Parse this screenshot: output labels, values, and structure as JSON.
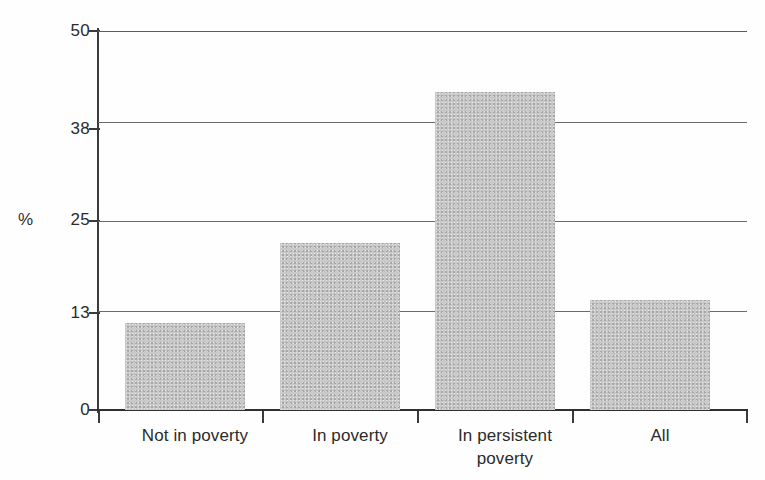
{
  "chart_data": {
    "type": "bar",
    "title": "",
    "subtitle": "",
    "xlabel": "",
    "ylabel": "%",
    "ylim": [
      0,
      50
    ],
    "yticks": [
      0,
      13,
      25,
      38,
      50
    ],
    "ytick_labels": [
      "0",
      "13",
      "25",
      "38",
      "50"
    ],
    "grid": "horizontal",
    "legend": "none",
    "bar_color": "#c9c9c9",
    "axis_color": "#2f2f2f",
    "categories": [
      "Not in poverty",
      "In poverty",
      "In persistent poverty",
      "All"
    ],
    "category_lines": [
      [
        "Not in poverty"
      ],
      [
        "In poverty"
      ],
      [
        "In persistent",
        "poverty"
      ],
      [
        "All"
      ]
    ],
    "values": [
      11.5,
      22,
      42,
      14.5
    ],
    "series": [
      {
        "name": "",
        "values": [
          11.5,
          22,
          42,
          14.5
        ]
      }
    ]
  }
}
